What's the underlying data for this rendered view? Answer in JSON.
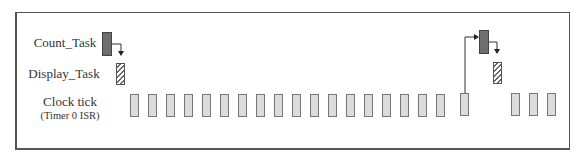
{
  "diagram": {
    "rows": [
      {
        "id": "count_task",
        "label": "Count_Task"
      },
      {
        "id": "display_task",
        "label": "Display_Task"
      },
      {
        "id": "clock_tick",
        "label": "Clock tick",
        "sublabel": "(Timer 0 ISR)"
      }
    ],
    "clock_tick_count": 21,
    "gap_after_tick_index": 17,
    "colors": {
      "count_task_fill": "#6e6e6e",
      "display_task_pattern": "hatched",
      "clock_tick_fill": "#dcdcdc",
      "border": "#555555"
    },
    "events": [
      {
        "tick_before": "start",
        "count_task": true,
        "display_task": true
      },
      {
        "tick_before": 18,
        "count_task": true,
        "display_task": true
      }
    ]
  }
}
